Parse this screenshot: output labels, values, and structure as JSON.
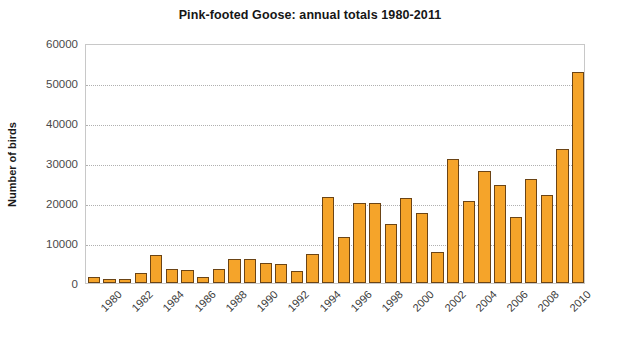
{
  "chart_data": {
    "type": "bar",
    "title": "Pink-footed Goose: annual totals 1980-2011",
    "xlabel": "",
    "ylabel": "Number of birds",
    "ylim": [
      0,
      60000
    ],
    "ytick_labels": [
      "60000",
      "50000",
      "40000",
      "30000",
      "20000",
      "10000",
      "0"
    ],
    "ytick_values": [
      60000,
      50000,
      40000,
      30000,
      20000,
      10000,
      0
    ],
    "grid": true,
    "legend": "none",
    "xtick_labels": [
      "1980",
      "1982",
      "1984",
      "1986",
      "1988",
      "1990",
      "1992",
      "1994",
      "1996",
      "1998",
      "2000",
      "2002",
      "2004",
      "2006",
      "2008",
      "2010"
    ],
    "categories": [
      "1980",
      "1981",
      "1982",
      "1983",
      "1984",
      "1985",
      "1986",
      "1987",
      "1988",
      "1989",
      "1990",
      "1991",
      "1992",
      "1993",
      "1994",
      "1995",
      "1996",
      "1997",
      "1998",
      "1999",
      "2000",
      "2001",
      "2002",
      "2003",
      "2004",
      "2005",
      "2006",
      "2007",
      "2008",
      "2009",
      "2010",
      "2011"
    ],
    "values": [
      1600,
      900,
      1100,
      2500,
      7000,
      3400,
      3300,
      1400,
      3500,
      6000,
      6100,
      4900,
      4700,
      3000,
      7200,
      21500,
      11500,
      20000,
      19900,
      14800,
      21300,
      17500,
      7800,
      31000,
      20400,
      27900,
      24400,
      16500,
      25900,
      22000,
      33400,
      52800
    ],
    "bar_color": "#F5A42A",
    "bar_edge_color": "#6B4415",
    "background_color": "#FFFFFF",
    "plot_border_color": "#C8C8C8"
  }
}
